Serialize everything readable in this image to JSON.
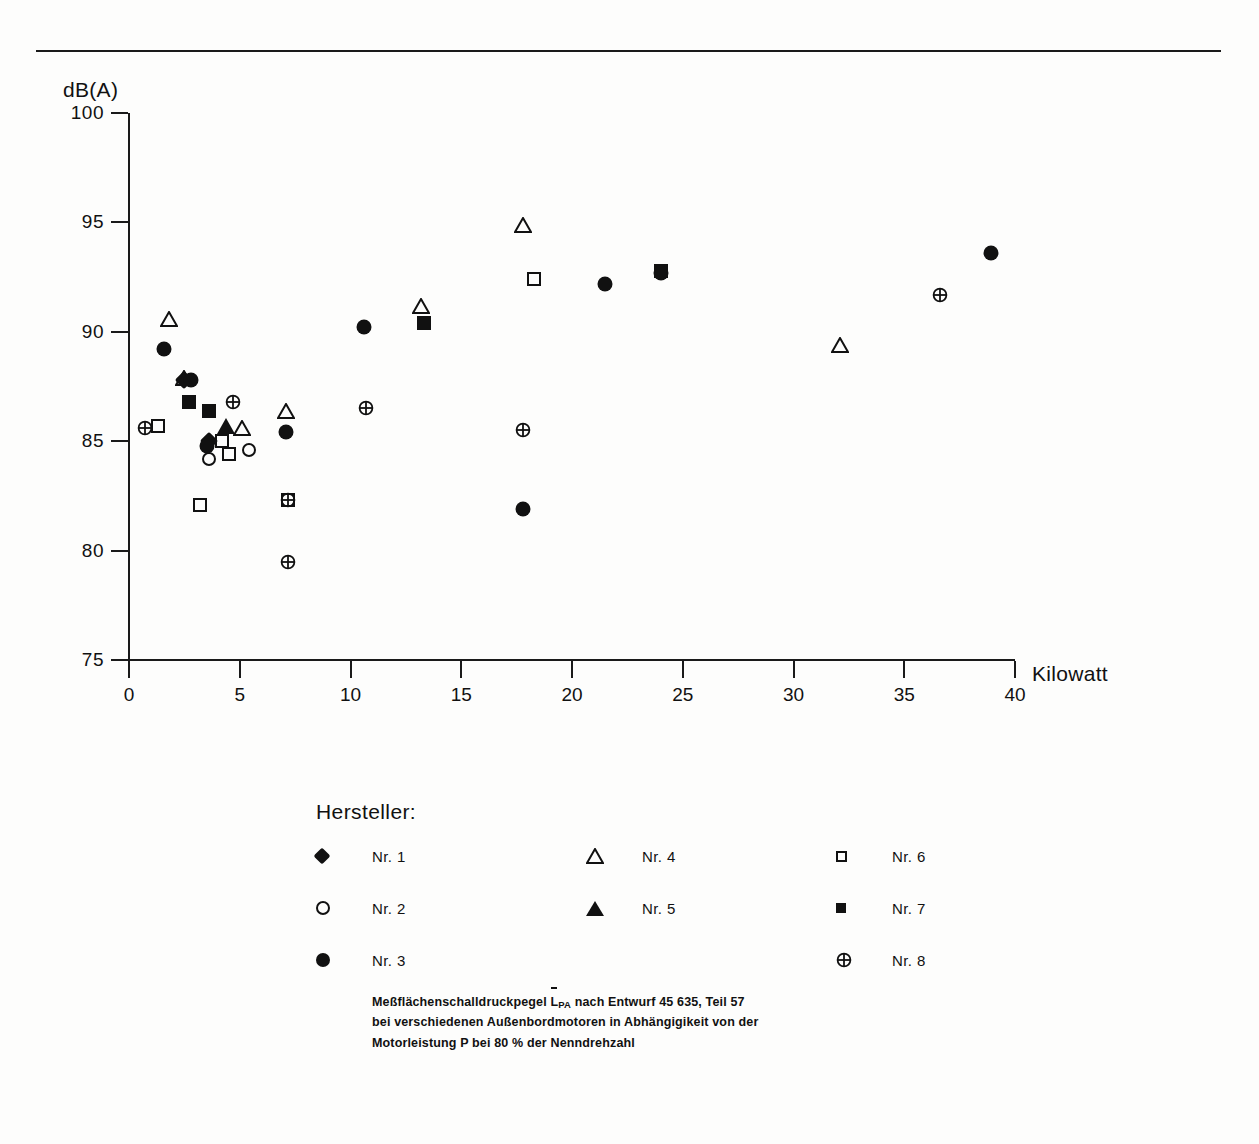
{
  "axes": {
    "y_title": "dB(A)",
    "x_title": "Kilowatt",
    "y_ticks": [
      "100",
      "95",
      "90",
      "85",
      "80",
      "75"
    ],
    "x_ticks": [
      "0",
      "5",
      "10",
      "15",
      "20",
      "25",
      "30",
      "35",
      "40"
    ]
  },
  "legend": {
    "title": "Hersteller:",
    "items": [
      {
        "label": "Nr. 1",
        "marker": "diamond-filled"
      },
      {
        "label": "Nr. 2",
        "marker": "circle-open"
      },
      {
        "label": "Nr. 3",
        "marker": "circle-filled"
      },
      {
        "label": "Nr. 4",
        "marker": "triangle-open"
      },
      {
        "label": "Nr. 5",
        "marker": "triangle-filled"
      },
      {
        "label": "Nr. 6",
        "marker": "square-open"
      },
      {
        "label": "Nr. 7",
        "marker": "square-filled"
      },
      {
        "label": "Nr. 8",
        "marker": "circle-crossed"
      }
    ]
  },
  "caption": {
    "line1_a": "Meßflächenschalldruckpegel ",
    "line1_sym": "L",
    "line1_sub": "PA",
    "line1_b": " nach Entwurf 45 635, Teil 57",
    "line2": "bei verschiedenen Außenbordmotoren in Abhängigikeit von der",
    "line3": "Motorleistung P bei 80 % der Nenndrehzahl"
  },
  "chart_data": {
    "type": "scatter",
    "title": "",
    "xlabel": "Kilowatt",
    "ylabel": "dB(A)",
    "xlim": [
      0,
      40
    ],
    "ylim": [
      75,
      100
    ],
    "grid": false,
    "legend_position": "below-plot",
    "series": [
      {
        "name": "Nr. 1",
        "marker": "diamond-filled",
        "points": [
          [
            2.5,
            87.8
          ],
          [
            3.6,
            85.0
          ]
        ]
      },
      {
        "name": "Nr. 2",
        "marker": "circle-open",
        "points": [
          [
            3.6,
            84.2
          ],
          [
            5.4,
            84.6
          ]
        ]
      },
      {
        "name": "Nr. 3",
        "marker": "circle-filled",
        "points": [
          [
            1.6,
            89.2
          ],
          [
            2.8,
            87.8
          ],
          [
            3.5,
            84.8
          ],
          [
            7.1,
            85.4
          ],
          [
            10.6,
            90.2
          ],
          [
            17.8,
            81.9
          ],
          [
            21.5,
            92.2
          ],
          [
            24.0,
            92.7
          ],
          [
            38.9,
            93.6
          ]
        ]
      },
      {
        "name": "Nr. 4",
        "marker": "triangle-open",
        "points": [
          [
            1.8,
            90.6
          ],
          [
            2.5,
            87.9
          ],
          [
            5.1,
            85.6
          ],
          [
            7.1,
            86.4
          ],
          [
            13.2,
            91.2
          ],
          [
            17.8,
            94.9
          ],
          [
            32.1,
            89.4
          ]
        ]
      },
      {
        "name": "Nr. 5",
        "marker": "triangle-filled",
        "points": [
          [
            4.4,
            85.7
          ]
        ]
      },
      {
        "name": "Nr. 6",
        "marker": "square-open",
        "points": [
          [
            1.3,
            85.7
          ],
          [
            4.2,
            85.0
          ],
          [
            4.5,
            84.4
          ],
          [
            3.2,
            82.1
          ],
          [
            7.2,
            82.3
          ],
          [
            18.3,
            92.4
          ]
        ]
      },
      {
        "name": "Nr. 7",
        "marker": "square-filled",
        "points": [
          [
            2.7,
            86.8
          ],
          [
            3.6,
            86.4
          ],
          [
            13.3,
            90.4
          ],
          [
            24.0,
            92.8
          ]
        ]
      },
      {
        "name": "Nr. 8",
        "marker": "circle-crossed",
        "points": [
          [
            0.7,
            85.6
          ],
          [
            4.7,
            86.8
          ],
          [
            7.2,
            82.3
          ],
          [
            7.2,
            79.5
          ],
          [
            10.7,
            86.5
          ],
          [
            17.8,
            85.5
          ],
          [
            36.6,
            91.7
          ]
        ]
      }
    ]
  }
}
